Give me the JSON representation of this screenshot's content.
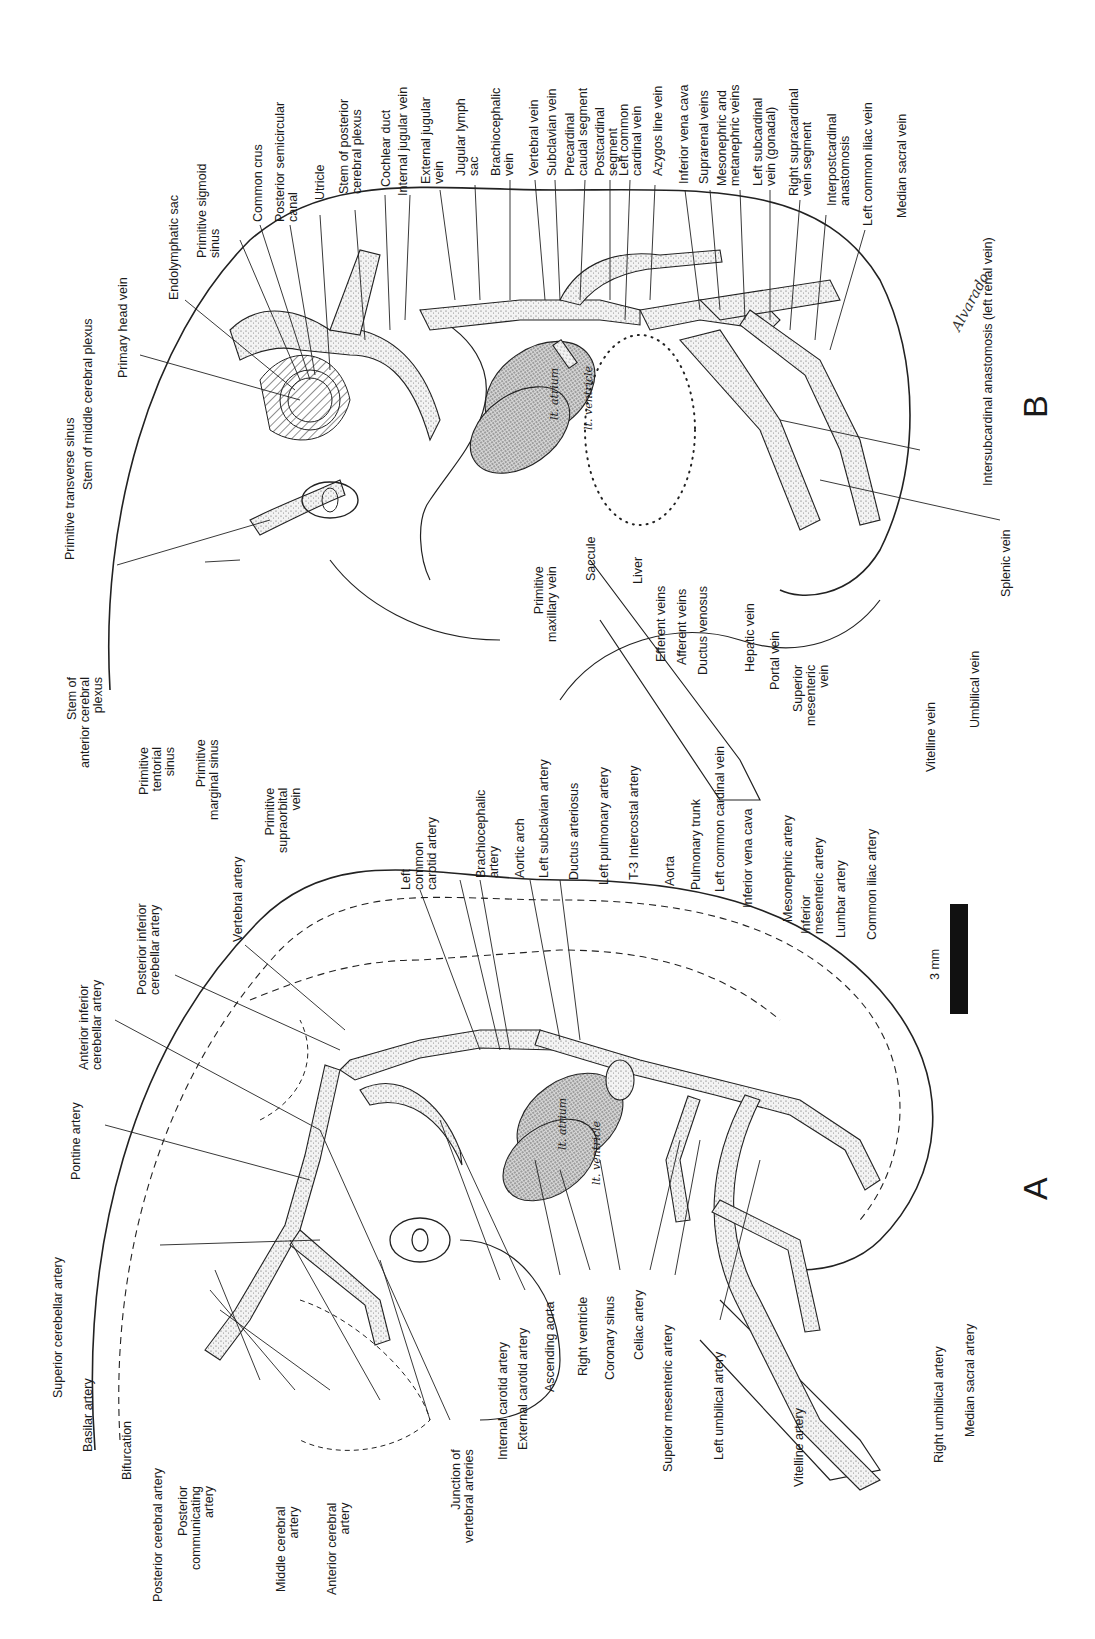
{
  "figure": {
    "orientation": "rotated 90 degrees counter-clockwise",
    "scale_bar": {
      "label": "3 mm"
    },
    "signature": "Alvarado",
    "panel_a": {
      "letter": "A",
      "subject": "arterial system",
      "heart_labels": {
        "atrium": "lt. atrium",
        "ventricle": "lt. ventricle"
      },
      "labels": [
        "Superior cerebellar artery",
        "Basilar artery",
        "Bifurcation",
        "Posterior cerebral artery",
        "Posterior\ncommunicating\nartery",
        "Middle cerebral\nartery",
        "Anterior cerebral\nartery",
        "Pontine artery",
        "Anterior inferior\ncerebellar artery",
        "Posterior inferior\ncerebellar artery",
        "Vertebral artery",
        "Junction of\nvertebral arteries",
        "Internal carotid artery",
        "External carotid artery",
        "Ascending aorta",
        "Right ventricle",
        "Coronary sinus",
        "Celiac artery",
        "Superior mesenteric artery",
        "Left umbilical artery",
        "Vitelline artery",
        "Right umbilical artery",
        "Median sacral artery",
        "Left\ncommon\ncarotid artery",
        "Brachiocephalic\nartery",
        "Aortic arch",
        "Left subclavian artery",
        "Ductus arteriosus",
        "Left pulmonary artery",
        "T-3 Intercostal artery",
        "Aorta",
        "Pulmonary trunk",
        "Left common cardinal vein",
        "Inferior vena cava",
        "Mesonephric artery",
        "Inferior\nmesenteric artery",
        "Lumbar artery",
        "Common iliac artery"
      ]
    },
    "panel_b": {
      "letter": "B",
      "subject": "venous system",
      "heart_labels": {
        "atrium": "lt. atrium",
        "ventricle": "lt. ventricle"
      },
      "labels": [
        "Primitive transverse sinus",
        "Stem of middle cerebral plexus",
        "Primary head vein",
        "Endolymphatic sac",
        "Primitive sigmoid\nsinus",
        "Common crus",
        "Posterior semicircular\ncanal",
        "Utricle",
        "Stem of posterior\ncerebral plexus",
        "Cochlear duct",
        "Internal jugular vein",
        "External jugular\nvein",
        "Jugular lymph\nsac",
        "Brachiocephalic\nvein",
        "Vertebral vein",
        "Subclavian vein",
        "Precardinal\ncaudal segment",
        "Postcardinal\nsegment",
        "Left common\ncardinal vein",
        "Azygos line vein",
        "Inferior vena cava",
        "Suprarenal veins",
        "Mesonephric and\nmetanephric veins",
        "Left subcardinal\nvein (gonadal)",
        "Right supracardinal\nvein segment",
        "Interpostcardinal\nanastomosis",
        "Left common iliac vein",
        "Median sacral vein",
        "Intersubcardinal anastomosis (left renal vein)",
        "Stem of\nanterior cerebral\nplexus",
        "Primitive\ntentorial\nsinus",
        "Primitive\nmarginal sinus",
        "Primitive\nsupraorbital\nvein",
        "Primitive\nmaxillary vein",
        "Saccule",
        "Liver",
        "Efferent veins",
        "Afferent veins",
        "Ductus venosus",
        "Hepatic vein",
        "Portal vein",
        "Superior\nmesenteric\nvein",
        "Vitelline vein",
        "Umbilical vein",
        "Splenic vein"
      ]
    }
  }
}
